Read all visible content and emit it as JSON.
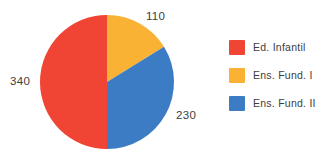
{
  "chart_data": {
    "type": "pie",
    "title": "",
    "categories": [
      "Ed. Infantil",
      "Ens. Fund. I",
      "Ens. Fund. II"
    ],
    "values": [
      340,
      110,
      230
    ],
    "total": 680,
    "colors": [
      "#F04434",
      "#F9B233",
      "#3B7CC4"
    ],
    "legend_position": "right",
    "grid": false,
    "start_angle_deg": 0,
    "direction": "clockwise",
    "slices": [
      {
        "label": "Ens. Fund. I",
        "value": 110,
        "value_text": "110",
        "color": "#F9B233",
        "percent": 16.2,
        "start_deg": 0,
        "sweep_deg": 58.24
      },
      {
        "label": "Ens. Fund. II",
        "value": 230,
        "value_text": "230",
        "color": "#3B7CC4",
        "percent": 33.8,
        "start_deg": 58.24,
        "sweep_deg": 121.76
      },
      {
        "label": "Ed. Infantil",
        "value": 340,
        "value_text": "340",
        "color": "#F04434",
        "percent": 50.0,
        "start_deg": 180,
        "sweep_deg": 180
      }
    ]
  },
  "labels": {
    "top": "110",
    "left": "340",
    "bottom_right": "230"
  },
  "legend": {
    "items": [
      {
        "label": "Ed. Infantil",
        "color": "#F04434"
      },
      {
        "label": "Ens. Fund. I",
        "color": "#F9B233"
      },
      {
        "label": "Ens. Fund. II",
        "color": "#3B7CC4"
      }
    ]
  }
}
